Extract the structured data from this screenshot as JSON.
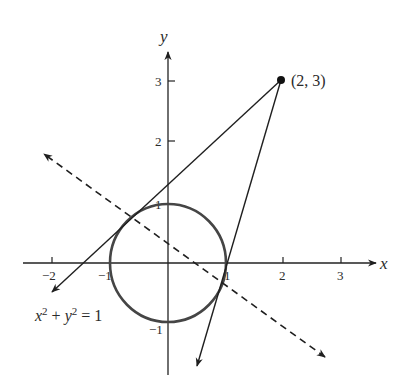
{
  "diagram": {
    "title": "",
    "axes": {
      "x_label": "x",
      "y_label": "y",
      "x_ticks": [
        {
          "value": -2,
          "label": "−2"
        },
        {
          "value": -1,
          "label": "−1"
        },
        {
          "value": 1,
          "label": "1"
        },
        {
          "value": 2,
          "label": "2"
        },
        {
          "value": 3,
          "label": "3"
        }
      ],
      "y_ticks": [
        {
          "value": 3,
          "label": "3"
        },
        {
          "value": 2,
          "label": "2"
        },
        {
          "value": 1,
          "label": "1"
        },
        {
          "value": -1,
          "label": "−1"
        }
      ],
      "x_range": [
        -2.5,
        3.5
      ],
      "y_range": [
        -1.9,
        3.6
      ]
    },
    "circle": {
      "equation_label": "x² + y² = 1",
      "equation_parts": {
        "x": "x",
        "sup1": "2",
        "plus": " + ",
        "y": "y",
        "sup2": "2",
        "rhs": " = 1"
      },
      "center": [
        0,
        0
      ],
      "radius": 1
    },
    "external_point": {
      "label": "(2, 3)",
      "coords": [
        2,
        3
      ]
    },
    "tangent_lines": [
      {
        "name": "upper-left tangent",
        "from": [
          2,
          3
        ],
        "tangent_point": [
          -0.645,
          0.763
        ]
      },
      {
        "name": "lower-right tangent",
        "from": [
          2,
          3
        ],
        "tangent_point": [
          0.953,
          -0.302
        ]
      }
    ],
    "polar_line": {
      "style": "dashed",
      "equation": "2x + 3y = 1"
    },
    "colors": {
      "background": "#ffffff",
      "axes": "#222222",
      "circle": "#454545",
      "lines": "#1f1f1f",
      "text": "#2a2a2a"
    }
  }
}
